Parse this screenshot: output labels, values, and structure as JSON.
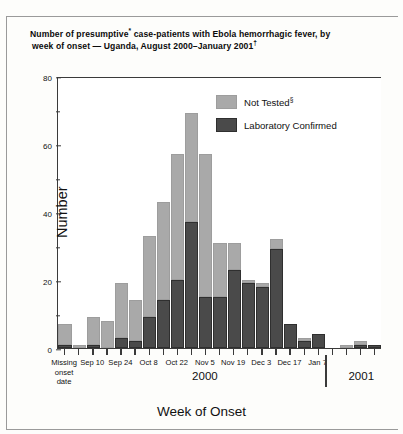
{
  "title": {
    "line1_pre": "Number of presumptive",
    "line1_sup": "*",
    "line1_post": " case-patients with Ebola hemorrhagic fever, by",
    "line2_pre": "week of onset — Uganda, August 2000–January 2001",
    "line2_sup": "†"
  },
  "axes": {
    "ylabel": "Number",
    "xlabel": "Week of Onset",
    "yticks_major": [
      "0",
      "20",
      "40",
      "60",
      "80"
    ],
    "yticks_minor": [
      "10",
      "30",
      "50",
      "70"
    ],
    "ylim": [
      0,
      80
    ],
    "year_labels": [
      "2000",
      "2001"
    ]
  },
  "legend": {
    "items": [
      {
        "label_pre": "Not Tested",
        "label_sup": "§",
        "color": "#a9a9a9",
        "name": "Not Tested§"
      },
      {
        "label_pre": "Laboratory Confirmed",
        "label_sup": "",
        "color": "#4a4a4a",
        "name": "Laboratory Confirmed"
      }
    ]
  },
  "chart_data": {
    "type": "bar",
    "subtype": "stacked-bar",
    "title": "Number of presumptive* case-patients with Ebola hemorrhagic fever, by week of onset — Uganda, August 2000–January 2001†",
    "xlabel": "Week of Onset",
    "ylabel": "Number",
    "ylim": [
      0,
      80
    ],
    "ytick_interval_major": 20,
    "ytick_interval_minor": 10,
    "grid": false,
    "legend_position": "inside top-right",
    "categories": [
      "Missing onset date",
      "Sep 3",
      "Sep 10",
      "Sep 17",
      "Sep 24",
      "Oct 1",
      "Oct 8",
      "Oct 15",
      "Oct 22",
      "Oct 29",
      "Nov 5",
      "Nov 12",
      "Nov 19",
      "Nov 26",
      "Dec 3",
      "Dec 10",
      "Dec 17",
      "Dec 24",
      "Dec 31",
      "Jan 7",
      "Jan 14",
      "Jan 21",
      "Jan 28"
    ],
    "tick_labels_shown": [
      "Missing onset date",
      "Sep 10",
      "Sep 24",
      "Oct 8",
      "Oct 22",
      "Nov 5",
      "Nov 19",
      "Dec 3",
      "Dec 17",
      "Jan 7"
    ],
    "series": [
      {
        "name": "Laboratory Confirmed",
        "color": "#4a4a4a",
        "values": [
          1,
          0,
          1,
          0,
          3,
          2,
          9,
          14,
          20,
          37,
          15,
          15,
          23,
          19,
          18,
          29,
          7,
          2,
          4,
          0,
          0,
          1,
          1
        ]
      },
      {
        "name": "Not Tested§",
        "color": "#a9a9a9",
        "values": [
          6,
          1,
          8,
          8,
          16,
          12,
          24,
          29,
          37,
          32,
          42,
          16,
          8,
          1,
          1,
          3,
          0,
          1,
          0,
          0,
          1,
          1,
          0
        ]
      }
    ],
    "totals": [
      7,
      1,
      9,
      8,
      19,
      14,
      33,
      43,
      57,
      69,
      57,
      31,
      31,
      20,
      19,
      32,
      7,
      3,
      4,
      0,
      1,
      2,
      1
    ]
  }
}
